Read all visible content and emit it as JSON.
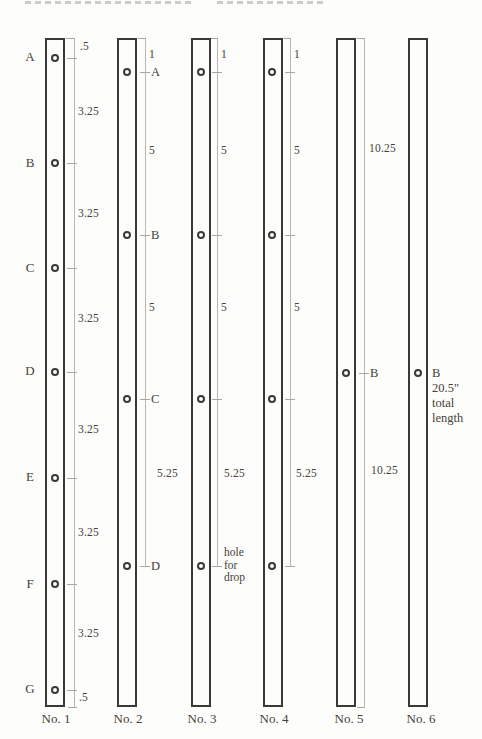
{
  "colors": {
    "ink": "#3b3936",
    "dim_line": "#b9b7ae",
    "text": "#454238"
  },
  "bars": [
    {
      "label": "No. 1",
      "side_letters": [
        "A",
        "B",
        "C",
        "D",
        "E",
        "F",
        "G"
      ],
      "dims": [
        ".5",
        "3.25",
        "3.25",
        "3.25",
        "3.25",
        "3.25",
        "3.25",
        ".5"
      ]
    },
    {
      "label": "No. 2",
      "hole_letters": [
        "A",
        "B",
        "C",
        "D"
      ],
      "dims": [
        "1",
        "5",
        "5",
        "5.25"
      ]
    },
    {
      "label": "No. 3",
      "dims": [
        "1",
        "5",
        "5",
        "5.25"
      ],
      "note_lines": [
        "hole",
        "for",
        "drop"
      ]
    },
    {
      "label": "No. 4",
      "dims": [
        "1",
        "5",
        "5",
        "5.25"
      ]
    },
    {
      "label": "No. 5",
      "hole_letters": [
        "B"
      ],
      "dims": [
        "10.25",
        "10.25"
      ]
    },
    {
      "label": "No. 6",
      "hole_letters": [
        "B"
      ],
      "annotation_lines": [
        "20.5\"",
        "total",
        "length"
      ]
    }
  ]
}
